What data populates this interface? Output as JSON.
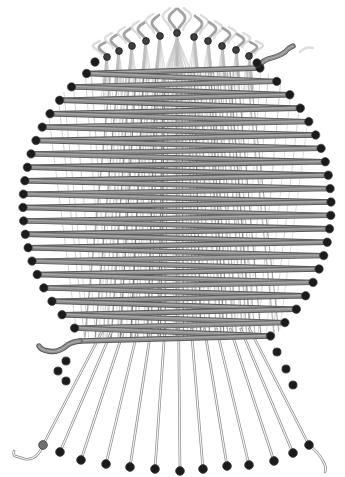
{
  "figure": {
    "canvas": {
      "width": 345,
      "height": 477,
      "background": "#ffffff"
    },
    "sphere": {
      "cx": 177,
      "cy": 206,
      "rx": 160,
      "ry": 166,
      "row_spacing": 13.4,
      "left_row_count": 20,
      "right_row_count": 21,
      "left_first_y": 73.5,
      "right_first_y": 68,
      "edge_inset": 6
    },
    "warp": {
      "front_count": 46,
      "back_count": 30,
      "x_min": 76,
      "x_max": 278,
      "front_converge": 0.72,
      "back_converge": 1.28,
      "top_limit": 71,
      "bottom_limit": 337
    },
    "apex_fan": {
      "x": 177,
      "y": 34,
      "count": 22,
      "half_spread": 55,
      "reach_y": 200
    },
    "sprouts": [
      {
        "x": 107,
        "y": 57,
        "lean": -1,
        "h": 15
      },
      {
        "x": 119,
        "y": 51,
        "lean": -1,
        "h": 17
      },
      {
        "x": 132,
        "y": 46,
        "lean": -1,
        "h": 18
      },
      {
        "x": 146,
        "y": 41,
        "lean": -1,
        "h": 19
      },
      {
        "x": 160,
        "y": 36,
        "lean": -1,
        "h": 21
      },
      {
        "x": 177,
        "y": 33,
        "lean": 0,
        "h": 24
      },
      {
        "x": 194,
        "y": 37,
        "lean": 1,
        "h": 21
      },
      {
        "x": 208,
        "y": 41,
        "lean": 1,
        "h": 19
      },
      {
        "x": 222,
        "y": 46,
        "lean": 1,
        "h": 18
      },
      {
        "x": 236,
        "y": 50,
        "lean": 1,
        "h": 16
      },
      {
        "x": 249,
        "y": 56,
        "lean": 1,
        "h": 14
      }
    ],
    "extra_beads": [
      [
        95,
        62
      ],
      [
        257,
        63
      ]
    ],
    "start_hook": "M260,68 Q260,62 268,59 Q280,56 285,52 Q288,48 293,46",
    "end_hook": "M80,341 Q70,342 65,347 Q57,353 48,351 Q41,350 39,346",
    "bottom": {
      "fringe_top_y": 329,
      "converge": 0.55,
      "beads": [
        [
          43,
          445
        ],
        [
          60,
          452
        ],
        [
          81,
          460
        ],
        [
          106,
          464
        ],
        [
          130,
          467
        ],
        [
          155,
          469
        ],
        [
          180,
          471
        ],
        [
          203,
          469
        ],
        [
          227,
          466
        ],
        [
          249,
          465
        ],
        [
          274,
          461
        ],
        [
          293,
          453
        ],
        [
          309,
          445
        ]
      ],
      "gray_bead_indices": [
        0
      ],
      "left_foot": "M43,446 Q36,461 25,459 L15,456 Q13,455 14,451",
      "right_foot": "M309,445 Q319,453 323,461 Q327,468 325,472",
      "side_beads_left": [
        [
          66,
          361
        ],
        [
          58,
          371
        ],
        [
          66,
          381
        ]
      ],
      "side_beads_right": [
        [
          277,
          352
        ],
        [
          286,
          369
        ],
        [
          293,
          385
        ]
      ],
      "corner_wisp": "M300,52 Q306,46 313,48"
    },
    "colors": {
      "background": "#ffffff",
      "thread_dark": "#5a5a5a",
      "thread_mid": "#8d8d8d",
      "thread_light": "#ababab",
      "bead_dark": "#1b1b1b",
      "bead_rim": "#484848",
      "bead_gray": "#6e6e6e",
      "sprout_bead": "#3f3f3f",
      "warp_shades": [
        "#777777",
        "#8c8c8c",
        "#a0a0a0",
        "#b4b4b4"
      ],
      "warp_back": "#c9c9c9",
      "fan": "#c6c6c6",
      "cone": "#c4c4c4",
      "stem": "#b0b0b0",
      "curl_main": "#a3a3a3",
      "curl_soft": "#d8d8d8",
      "fringe_edge": "#8a8a8a",
      "fringe_fill": "#f5f5f5"
    }
  }
}
